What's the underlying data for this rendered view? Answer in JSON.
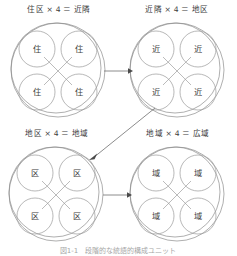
{
  "figure": {
    "caption": "図1-1　段階的な統語的構成ユニット",
    "groups": [
      {
        "id": "group-jukku",
        "title": "住区 × 4 ＝ 近隣",
        "unit_label": "住",
        "source_unit": "住区",
        "multiplier": "× 4",
        "result_unit": "近隣",
        "cells": [
          "住",
          "住",
          "住",
          "住"
        ]
      },
      {
        "id": "group-kinrin",
        "title": "近隣 × 4 ＝ 地区",
        "unit_label": "近",
        "source_unit": "近隣",
        "multiplier": "× 4",
        "result_unit": "地区",
        "cells": [
          "近",
          "近",
          "近",
          "近"
        ]
      },
      {
        "id": "group-chiku",
        "title": "地区 × 4 ＝ 地域",
        "unit_label": "区",
        "source_unit": "地区",
        "multiplier": "× 4",
        "result_unit": "地域",
        "cells": [
          "区",
          "区",
          "区",
          "区"
        ]
      },
      {
        "id": "group-chiiki",
        "title": "地域 × 4 ＝ 広域",
        "unit_label": "域",
        "source_unit": "地域",
        "multiplier": "× 4",
        "result_unit": "広域",
        "cells": [
          "域",
          "域",
          "域",
          "域"
        ]
      }
    ],
    "arrows": [
      {
        "id": "arrow-top-right",
        "from": "group-jukku",
        "to": "group-kinrin",
        "direction": "right"
      },
      {
        "id": "arrow-diagonal",
        "from": "group-kinrin",
        "to": "group-chiku",
        "direction": "down-left"
      },
      {
        "id": "arrow-bottom-right",
        "from": "group-chiku",
        "to": "group-chiiki",
        "direction": "right"
      }
    ],
    "colors": {
      "stroke": "#8c8c8c",
      "text": "#3c3c3c",
      "arrow": "#4a4a4a",
      "background": "#ffffff"
    }
  }
}
